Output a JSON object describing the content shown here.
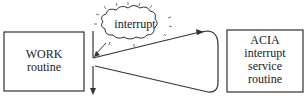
{
  "diagram": {
    "work_box": {
      "line1": "WORK",
      "line2": "routine"
    },
    "acia_box": {
      "line1": "ACIA",
      "line2": "interrupt",
      "line3": "service",
      "line4": "routine"
    },
    "cloud": {
      "label": "interrupt"
    }
  }
}
